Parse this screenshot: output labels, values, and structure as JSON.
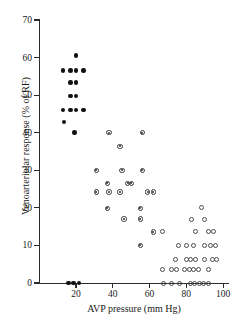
{
  "chart_data": {
    "type": "scatter",
    "title": "",
    "xlabel": "AVP pressure (mm Hg)",
    "ylabel": "Venoarteriolar response (% of RF)",
    "xlim": [
      0,
      104
    ],
    "ylim": [
      0,
      70
    ],
    "xticks": [
      20,
      40,
      60,
      80,
      100
    ],
    "yticks": [
      0,
      10,
      20,
      30,
      40,
      50,
      60,
      70
    ],
    "grid": false,
    "legend": "none",
    "series": [
      {
        "name": "filled-circle-group",
        "marker": "filled-circle",
        "color": "#111111",
        "points": [
          [
            20.0,
            60.5
          ],
          [
            13.0,
            56.6
          ],
          [
            17.0,
            56.6
          ],
          [
            20.0,
            56.6
          ],
          [
            24.0,
            56.6
          ],
          [
            17.0,
            53.4
          ],
          [
            20.0,
            53.4
          ],
          [
            17.0,
            49.8
          ],
          [
            20.0,
            49.8
          ],
          [
            13.0,
            46.0
          ],
          [
            17.0,
            46.0
          ],
          [
            20.0,
            46.0
          ],
          [
            24.0,
            46.0
          ],
          [
            13.5,
            42.8
          ],
          [
            19.0,
            40.0
          ],
          [
            16.0,
            0.0
          ],
          [
            18.5,
            0.0
          ],
          [
            21.5,
            0.0
          ]
        ]
      },
      {
        "name": "dotted-circle-group",
        "marker": "dotted-circle",
        "color": "#3a3a3a",
        "points": [
          [
            38.0,
            40.0
          ],
          [
            56.0,
            40.0
          ],
          [
            44.0,
            36.4
          ],
          [
            31.0,
            30.0
          ],
          [
            45.0,
            30.0
          ],
          [
            56.0,
            30.0
          ],
          [
            37.0,
            26.5
          ],
          [
            48.0,
            26.5
          ],
          [
            50.0,
            26.5
          ],
          [
            31.0,
            24.2
          ],
          [
            38.0,
            24.2
          ],
          [
            44.0,
            24.2
          ],
          [
            59.0,
            24.2
          ],
          [
            62.0,
            24.2
          ],
          [
            37.0,
            19.9
          ],
          [
            55.0,
            19.9
          ],
          [
            46.0,
            17.0
          ],
          [
            55.0,
            17.0
          ],
          [
            62.0,
            13.6
          ],
          [
            55.0,
            10.0
          ]
        ]
      },
      {
        "name": "open-circle-group",
        "marker": "open-circle",
        "color": "#4a4a4a",
        "points": [
          [
            88.0,
            20.0
          ],
          [
            83.0,
            17.0
          ],
          [
            90.0,
            17.0
          ],
          [
            67.0,
            13.6
          ],
          [
            85.0,
            13.6
          ],
          [
            92.0,
            13.6
          ],
          [
            95.0,
            13.6
          ],
          [
            76.0,
            10.0
          ],
          [
            80.0,
            10.0
          ],
          [
            84.0,
            10.0
          ],
          [
            90.0,
            10.0
          ],
          [
            93.0,
            10.0
          ],
          [
            96.0,
            10.0
          ],
          [
            74.0,
            6.3
          ],
          [
            80.0,
            6.3
          ],
          [
            82.5,
            6.3
          ],
          [
            85.0,
            6.3
          ],
          [
            90.0,
            6.3
          ],
          [
            94.0,
            6.3
          ],
          [
            96.5,
            6.3
          ],
          [
            67.0,
            3.6
          ],
          [
            72.0,
            3.6
          ],
          [
            74.5,
            3.6
          ],
          [
            79.0,
            3.6
          ],
          [
            81.5,
            3.6
          ],
          [
            84.0,
            3.6
          ],
          [
            86.5,
            3.6
          ],
          [
            92.0,
            3.6
          ],
          [
            67.5,
            0.0
          ],
          [
            72.0,
            0.0
          ],
          [
            76.5,
            0.0
          ],
          [
            82.0,
            0.0
          ],
          [
            84.5,
            0.0
          ],
          [
            87.0,
            0.0
          ],
          [
            89.5,
            0.0
          ],
          [
            92.0,
            0.0
          ]
        ]
      }
    ]
  }
}
